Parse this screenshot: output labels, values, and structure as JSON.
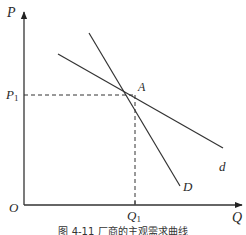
{
  "diagram": {
    "type": "economics-demand-curves",
    "axes": {
      "y_label": "P",
      "x_label": "Q",
      "origin_label": "O"
    },
    "point": {
      "label": "A",
      "price_label": "P",
      "price_sub": "1",
      "quantity_label": "Q",
      "quantity_sub": "1"
    },
    "curves": [
      {
        "name": "subjective-demand-curve",
        "label": "d",
        "from": [
          58,
          54
        ],
        "to": [
          223,
          148
        ]
      },
      {
        "name": "market-share-demand-curve",
        "label": "D",
        "from": [
          89,
          33
        ],
        "to": [
          180,
          186
        ]
      }
    ],
    "caption": "图 4-11   厂商的主观需求曲线"
  },
  "colors": {
    "line": "#333333",
    "text": "#2a2a2a",
    "background": "#ffffff"
  }
}
